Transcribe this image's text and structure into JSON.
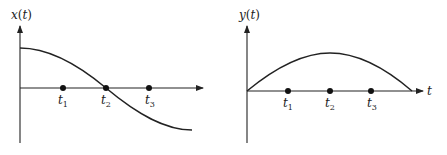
{
  "figure": {
    "left_panel": {
      "y_axis_label": "x(t)",
      "y_axis_label_func": "x",
      "y_axis_label_arg": "t",
      "curve_description": "cosine-like: starts at maximum, crosses zero at t2, decreases to minimum",
      "points": [
        {
          "name": "t",
          "sub": "1"
        },
        {
          "name": "t",
          "sub": "2"
        },
        {
          "name": "t",
          "sub": "3"
        }
      ]
    },
    "right_panel": {
      "y_axis_label": "y(t)",
      "y_axis_label_func": "y",
      "y_axis_label_arg": "t",
      "x_axis_label": "t",
      "curve_description": "sine-like half arch: starts at zero, maximum at t2, returns to zero",
      "points": [
        {
          "name": "t",
          "sub": "1"
        },
        {
          "name": "t",
          "sub": "2"
        },
        {
          "name": "t",
          "sub": "3"
        }
      ]
    },
    "colors": {
      "ink": "#222222",
      "background": "#ffffff"
    }
  }
}
